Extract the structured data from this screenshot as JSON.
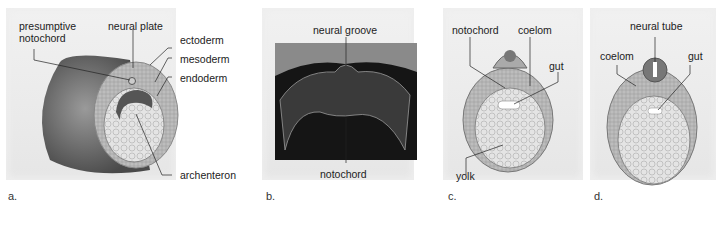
{
  "panels": [
    {
      "id": "a",
      "caption": "a.",
      "labels": {
        "presumptive_notochord": "presumptive\nnotochord",
        "presumptive_1": "presumptive",
        "presumptive_2": "notochord",
        "neural_plate": "neural plate",
        "ectoderm": "ectoderm",
        "mesoderm": "mesoderm",
        "endoderm": "endoderm",
        "archenteron": "archenteron"
      }
    },
    {
      "id": "b",
      "caption": "b.",
      "labels": {
        "neural_groove": "neural groove",
        "notochord": "notochord"
      }
    },
    {
      "id": "c",
      "caption": "c.",
      "labels": {
        "notochord": "notochord",
        "coelom": "coelom",
        "gut": "gut",
        "yolk": "yolk"
      }
    },
    {
      "id": "d",
      "caption": "d.",
      "labels": {
        "neural_tube": "neural tube",
        "coelom": "coelom",
        "gut": "gut"
      }
    }
  ]
}
